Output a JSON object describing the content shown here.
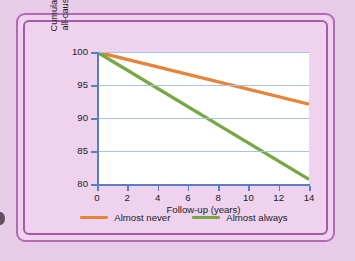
{
  "figure": {
    "background_color": "#e8cbe8",
    "panel_color": "#eed2ee",
    "frame_color": "#b36ab3"
  },
  "chart_data": {
    "type": "line",
    "title": "",
    "xlabel": "Follow-up (years)",
    "ylabel_line1": "Cumulative survival for",
    "ylabel_line2": "all-cause mortality (%)",
    "xlim": [
      0,
      14
    ],
    "ylim": [
      80,
      100
    ],
    "xticks": [
      0,
      2,
      4,
      6,
      8,
      10,
      12,
      14
    ],
    "yticks": [
      80,
      85,
      90,
      95,
      100
    ],
    "grid": "horizontal",
    "grid_color": "#a8c4e2",
    "axis_color": "#5a7fc0",
    "plot_background": "#ffffff",
    "legend_position": "below",
    "series": [
      {
        "name": "Almost never",
        "color": "#e8833a",
        "x": [
          0,
          14
        ],
        "values": [
          100,
          92.1
        ]
      },
      {
        "name": "Almost always",
        "color": "#76a844",
        "x": [
          0,
          14
        ],
        "values": [
          100,
          80.7
        ]
      }
    ]
  },
  "legend": {
    "items": [
      {
        "label": "Almost never",
        "color": "#e8833a"
      },
      {
        "label": "Almost always",
        "color": "#76a844"
      }
    ]
  },
  "ytick_labels": [
    "100",
    "95",
    "90",
    "85",
    "80"
  ],
  "xtick_labels": [
    "0",
    "2",
    "4",
    "6",
    "8",
    "10",
    "12",
    "14"
  ]
}
